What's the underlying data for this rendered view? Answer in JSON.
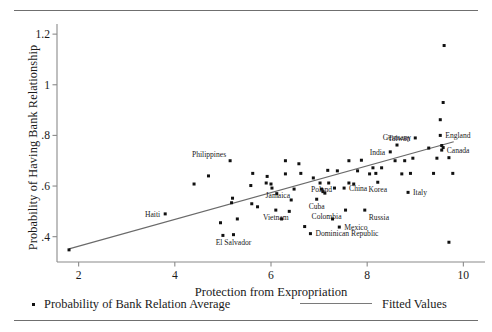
{
  "figure": {
    "ylabel": "Probability of Having Bank Relationship",
    "xlabel": "Protection from Expropriation"
  },
  "legend": {
    "points_label": "Probability of Bank Relation Average",
    "fitted_label": "Fitted Values",
    "point_marker": "square-dot-marker",
    "line_marker": "line-segment-marker"
  },
  "chart_data": {
    "type": "scatter",
    "title": "",
    "xlabel": "Protection from Expropriation",
    "ylabel": "Probability of Having Bank Relationship",
    "xlim": [
      1.55,
      10.45
    ],
    "ylim": [
      0.3,
      1.24
    ],
    "xticks": [
      2,
      4,
      6,
      8,
      10
    ],
    "xtick_labels": [
      "2",
      "4",
      "6",
      "8",
      "10"
    ],
    "yticks": [
      0.4,
      0.6,
      0.8,
      1.0,
      1.2
    ],
    "ytick_labels": [
      ".4",
      ".6",
      ".8",
      "1",
      "1.2"
    ],
    "grid": false,
    "legend_position": "below-axes",
    "series": [
      {
        "name": "Probability of Bank Relation Average",
        "type": "scatter",
        "marker_color": "#111111",
        "points": [
          {
            "x": 1.8,
            "y": 0.348,
            "label": ""
          },
          {
            "x": 3.8,
            "y": 0.49,
            "label": "Haiti",
            "label_pos": "left"
          },
          {
            "x": 5.0,
            "y": 0.405,
            "label": ""
          },
          {
            "x": 5.22,
            "y": 0.408,
            "label": "El Salvador",
            "label_pos": "below"
          },
          {
            "x": 4.95,
            "y": 0.455,
            "label": ""
          },
          {
            "x": 5.3,
            "y": 0.47,
            "label": ""
          },
          {
            "x": 5.18,
            "y": 0.534,
            "label": ""
          },
          {
            "x": 5.2,
            "y": 0.552,
            "label": ""
          },
          {
            "x": 4.4,
            "y": 0.608,
            "label": ""
          },
          {
            "x": 5.6,
            "y": 0.53,
            "label": ""
          },
          {
            "x": 5.72,
            "y": 0.518,
            "label": ""
          },
          {
            "x": 5.58,
            "y": 0.602,
            "label": ""
          },
          {
            "x": 5.9,
            "y": 0.612,
            "label": ""
          },
          {
            "x": 6.0,
            "y": 0.608,
            "label": ""
          },
          {
            "x": 6.02,
            "y": 0.592,
            "label": ""
          },
          {
            "x": 5.62,
            "y": 0.65,
            "label": ""
          },
          {
            "x": 5.92,
            "y": 0.638,
            "label": ""
          },
          {
            "x": 4.7,
            "y": 0.64,
            "label": ""
          },
          {
            "x": 5.15,
            "y": 0.7,
            "label": "Philippines",
            "label_pos": "above-left"
          },
          {
            "x": 6.22,
            "y": 0.47,
            "label": ""
          },
          {
            "x": 6.3,
            "y": 0.648,
            "label": ""
          },
          {
            "x": 6.12,
            "y": 0.57,
            "label": ""
          },
          {
            "x": 6.42,
            "y": 0.545,
            "label": ""
          },
          {
            "x": 6.1,
            "y": 0.505,
            "label": "Vietnam",
            "label_pos": "below"
          },
          {
            "x": 6.38,
            "y": 0.5,
            "label": ""
          },
          {
            "x": 6.48,
            "y": 0.588,
            "label": "Jamaica",
            "label_pos": "below-left"
          },
          {
            "x": 6.7,
            "y": 0.44,
            "label": ""
          },
          {
            "x": 6.82,
            "y": 0.412,
            "label": "Dominican Republic",
            "label_pos": "right"
          },
          {
            "x": 6.95,
            "y": 0.548,
            "label": "Cuba",
            "label_pos": "below"
          },
          {
            "x": 7.05,
            "y": 0.588,
            "label": "Poland",
            "label_pos": "overlap"
          },
          {
            "x": 7.08,
            "y": 0.578,
            "label": ""
          },
          {
            "x": 7.12,
            "y": 0.572,
            "label": ""
          },
          {
            "x": 7.02,
            "y": 0.612,
            "label": ""
          },
          {
            "x": 6.88,
            "y": 0.632,
            "label": ""
          },
          {
            "x": 7.2,
            "y": 0.612,
            "label": ""
          },
          {
            "x": 7.18,
            "y": 0.662,
            "label": ""
          },
          {
            "x": 7.38,
            "y": 0.66,
            "label": ""
          },
          {
            "x": 7.32,
            "y": 0.592,
            "label": ""
          },
          {
            "x": 7.28,
            "y": 0.47,
            "label": ""
          },
          {
            "x": 7.42,
            "y": 0.438,
            "label": "Mexico",
            "label_pos": "right"
          },
          {
            "x": 7.55,
            "y": 0.505,
            "label": "Colombia",
            "label_pos": "below-left"
          },
          {
            "x": 7.52,
            "y": 0.592,
            "label": "China",
            "label_pos": "right"
          },
          {
            "x": 7.62,
            "y": 0.612,
            "label": ""
          },
          {
            "x": 7.72,
            "y": 0.608,
            "label": ""
          },
          {
            "x": 7.62,
            "y": 0.7,
            "label": ""
          },
          {
            "x": 7.8,
            "y": 0.66,
            "label": ""
          },
          {
            "x": 7.95,
            "y": 0.505,
            "label": "Russia",
            "label_pos": "below-right"
          },
          {
            "x": 8.05,
            "y": 0.648,
            "label": ""
          },
          {
            "x": 8.18,
            "y": 0.65,
            "label": ""
          },
          {
            "x": 8.12,
            "y": 0.672,
            "label": ""
          },
          {
            "x": 8.3,
            "y": 0.672,
            "label": ""
          },
          {
            "x": 8.22,
            "y": 0.615,
            "label": "Korea",
            "label_pos": "below"
          },
          {
            "x": 8.48,
            "y": 0.735,
            "label": "India",
            "label_pos": "left"
          },
          {
            "x": 8.62,
            "y": 0.762,
            "label": "Germany",
            "label_pos": "above"
          },
          {
            "x": 8.72,
            "y": 0.648,
            "label": ""
          },
          {
            "x": 8.9,
            "y": 0.65,
            "label": ""
          },
          {
            "x": 8.78,
            "y": 0.7,
            "label": ""
          },
          {
            "x": 8.95,
            "y": 0.71,
            "label": ""
          },
          {
            "x": 8.85,
            "y": 0.575,
            "label": "Italy",
            "label_pos": "right"
          },
          {
            "x": 9.0,
            "y": 0.79,
            "label": "Taiwan",
            "label_pos": "left"
          },
          {
            "x": 9.28,
            "y": 0.75,
            "label": ""
          },
          {
            "x": 9.38,
            "y": 0.65,
            "label": ""
          },
          {
            "x": 9.45,
            "y": 0.71,
            "label": ""
          },
          {
            "x": 9.52,
            "y": 0.8,
            "label": "England",
            "label_pos": "right"
          },
          {
            "x": 9.55,
            "y": 0.742,
            "label": "Canada",
            "label_pos": "right"
          },
          {
            "x": 9.55,
            "y": 0.76,
            "label": ""
          },
          {
            "x": 9.58,
            "y": 0.752,
            "label": ""
          },
          {
            "x": 9.52,
            "y": 0.862,
            "label": ""
          },
          {
            "x": 9.58,
            "y": 0.93,
            "label": ""
          },
          {
            "x": 9.6,
            "y": 1.155,
            "label": ""
          },
          {
            "x": 9.7,
            "y": 0.712,
            "label": ""
          },
          {
            "x": 9.78,
            "y": 0.65,
            "label": ""
          },
          {
            "x": 9.7,
            "y": 0.378,
            "label": ""
          },
          {
            "x": 6.62,
            "y": 0.65,
            "label": ""
          },
          {
            "x": 6.58,
            "y": 0.688,
            "label": ""
          },
          {
            "x": 6.3,
            "y": 0.7,
            "label": ""
          },
          {
            "x": 7.88,
            "y": 0.702,
            "label": ""
          },
          {
            "x": 8.58,
            "y": 0.7,
            "label": ""
          }
        ]
      },
      {
        "name": "Fitted Values",
        "type": "line",
        "line_color": "#6a6a6a",
        "x": [
          1.8,
          9.8
        ],
        "y": [
          0.352,
          0.775
        ]
      }
    ]
  }
}
